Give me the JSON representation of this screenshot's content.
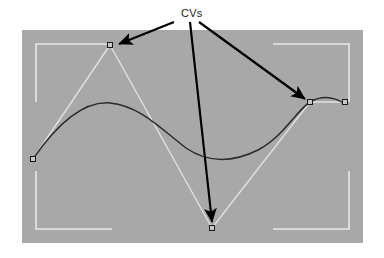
{
  "figure": {
    "kind": "spline-control-vertex-diagram",
    "background_color": "#ffffff",
    "annotation": {
      "label": "CVs",
      "label_x": 181,
      "label_y": 8,
      "text_color": "#1a1a1a",
      "arrow_color": "#000000",
      "arrows": [
        {
          "name": "arrow-to-peak-cv",
          "x1": 174,
          "y1": 22,
          "x2": 119,
          "y2": 44
        },
        {
          "name": "arrow-to-bottom-cv",
          "x1": 190,
          "y1": 22,
          "x2": 212,
          "y2": 222
        },
        {
          "name": "arrow-to-right-cv",
          "x1": 199,
          "y1": 22,
          "x2": 305,
          "y2": 99
        }
      ]
    },
    "viewport": {
      "name": "viewport-panel",
      "x": 22,
      "y": 30,
      "width": 341,
      "height": 213,
      "fill_color": "#a8a8a8",
      "corner_brackets": {
        "color": "#e8e8e8",
        "inset_x": 14,
        "inset_y": 14,
        "arm_length_x": 76,
        "arm_length_y": 58,
        "stroke_width": 1.6
      }
    },
    "hull": {
      "name": "control-polygon",
      "color": "#e0e0e0",
      "stroke_width": 1.4,
      "points": [
        {
          "x": 33,
          "y": 159
        },
        {
          "x": 110,
          "y": 45
        },
        {
          "x": 212,
          "y": 228
        },
        {
          "x": 310,
          "y": 102
        },
        {
          "x": 345,
          "y": 102
        }
      ]
    },
    "curve": {
      "name": "spline-curve",
      "color": "#2b2b2b",
      "stroke_width": 1.5,
      "path": "M 33 159 C 60 120 85 101 110 103 C 140 106 160 128 186 148 C 208 163 232 163 258 150 C 284 136 297 110 310 102 C 324 94 336 98 345 104"
    },
    "control_vertices": [
      {
        "name": "cv-left",
        "x": 33,
        "y": 159,
        "label": "CV1"
      },
      {
        "name": "cv-peak",
        "x": 110,
        "y": 45,
        "label": "CV2"
      },
      {
        "name": "cv-bottom",
        "x": 212,
        "y": 228,
        "label": "CV3"
      },
      {
        "name": "cv-right-inner",
        "x": 310,
        "y": 102,
        "label": "CV4"
      },
      {
        "name": "cv-right-outer",
        "x": 345,
        "y": 102,
        "label": "CV5"
      }
    ],
    "cv_marker": {
      "size": 5,
      "fill_color": "#c8c8c8",
      "stroke_color": "#1a1a1a",
      "stroke_width": 1
    }
  },
  "chart_data": {
    "type": "line",
    "title": "CVs",
    "xlabel": "",
    "ylabel": "",
    "xlim": [
      22,
      363
    ],
    "ylim": [
      30,
      243
    ],
    "grid": false,
    "legend": "none",
    "series": [
      {
        "name": "control-polygon",
        "x": [
          33,
          110,
          212,
          310,
          345
        ],
        "y": [
          159,
          45,
          228,
          102,
          102
        ]
      },
      {
        "name": "spline-curve",
        "x": [
          33,
          60,
          85,
          110,
          140,
          160,
          186,
          208,
          232,
          258,
          284,
          297,
          310,
          324,
          336,
          345
        ],
        "y": [
          159,
          125,
          107,
          103,
          110,
          122,
          148,
          158,
          161,
          152,
          133,
          117,
          102,
          96,
          98,
          104
        ]
      }
    ],
    "annotations": [
      {
        "text": "CVs",
        "x": 181,
        "y": 8
      }
    ]
  }
}
